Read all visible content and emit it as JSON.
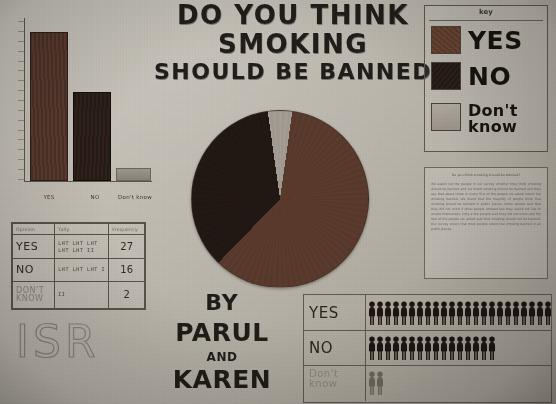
{
  "poster": {
    "title_line1": "DO YOU THINK",
    "title_line2": "SMOKING",
    "title_line3": "SHOULD BE BANNED",
    "byline_by": "BY",
    "byline_name1": "PARUL",
    "byline_and": "AND",
    "byline_name2": "KAREN",
    "school_mark": "ISR",
    "background_color": "#bdb8ae"
  },
  "key": {
    "heading": "key",
    "items": [
      {
        "label": "YES",
        "color": "#5a3a2c"
      },
      {
        "label": "NO",
        "color": "#211713"
      },
      {
        "label": "Don't know",
        "color": "#a49e95"
      }
    ]
  },
  "tally_table": {
    "headers": [
      "Opinion",
      "Tally",
      "Frequency"
    ],
    "rows": [
      {
        "option": "YES",
        "tally": "LHT LHT LHT LHT LHT II",
        "frequency": "27"
      },
      {
        "option": "NO",
        "tally": "LHT LHT LHT I",
        "frequency": "16"
      },
      {
        "option": "DON'T KNOW",
        "tally": "II",
        "frequency": "2"
      }
    ]
  },
  "chart_data": [
    {
      "type": "bar",
      "title": "Do you think smoking should be banned",
      "categories": [
        "YES",
        "NO",
        "Don't know"
      ],
      "values": [
        27,
        16,
        2
      ],
      "xlabel": "",
      "ylabel": "",
      "ylim": [
        0,
        30
      ],
      "grid": false,
      "legend": "none",
      "colors": [
        "#5a3a2c",
        "#211713",
        "#a49e95"
      ]
    },
    {
      "type": "pie",
      "title": "Do you think smoking should be banned",
      "labels": [
        "YES",
        "NO",
        "Don't know"
      ],
      "values": [
        27,
        16,
        2
      ],
      "percentages": [
        60,
        35.6,
        4.4
      ],
      "angles_deg": [
        216,
        128,
        16
      ],
      "colors": [
        "#5a3a2c",
        "#211713",
        "#a49e95"
      ],
      "legend": "top-right",
      "start_angle_deg": 0
    },
    {
      "type": "bar",
      "title": "Pictogram of responses",
      "categories": [
        "YES",
        "NO",
        "Don't know"
      ],
      "values": [
        27,
        16,
        2
      ],
      "symbol": "person",
      "symbol_value": 1,
      "colors": [
        "#211713",
        "#211713",
        "#6b655d"
      ]
    }
  ],
  "pictogram": {
    "rows": [
      {
        "label": "YES",
        "count": 27
      },
      {
        "label": "NO",
        "count": 16
      },
      {
        "label": "Don't know",
        "count": 2
      }
    ]
  },
  "note": {
    "heading": "Do you think smoking should be banned?",
    "body": "We asked out the people in our survey whether they think smoking should be banned and we found smoking should be banned and they say that about three in every five of the people we asked would like smoking banned. We found that the majority of people think that smoking should be banned in public places. Some people said that they did not mind if other people smoked but they would not like to smoke themselves. Only a few people said they did not know and the rest of the people we asked said that smoking should not be banned. Our survey shows that most people would like smoking banned in all public places."
  }
}
